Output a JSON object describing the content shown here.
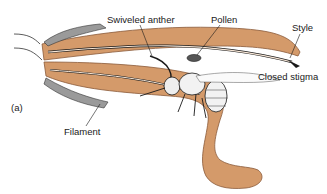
{
  "figure": {
    "panel_label": "(a)",
    "labels": {
      "swiveled_anther": "Swiveled anther",
      "pollen": "Pollen",
      "style": "Style",
      "closed_stigma": "Closed stigma",
      "filament": "Filament"
    },
    "colors": {
      "petal_fill": "#d49a6a",
      "petal_edge": "#8a5a3a",
      "highlight": "#f7e6d6",
      "ink": "#1a1a1a",
      "sepal_gray": "#8c8c8c"
    }
  }
}
